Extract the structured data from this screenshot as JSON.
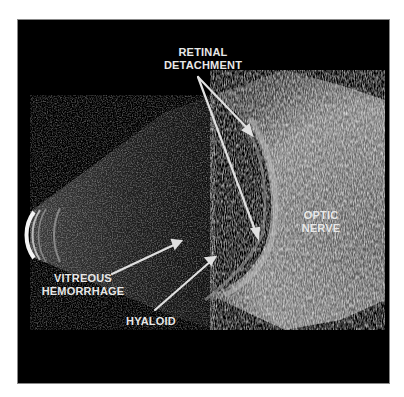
{
  "figure": {
    "type": "ocular B-scan ultrasound",
    "labels": {
      "retinal_detachment": [
        "RETINAL",
        "DETACHMENT"
      ],
      "optic_nerve": [
        "OPTIC",
        "NERVE"
      ],
      "vitreous_hemorrhage": [
        "VITREOUS",
        "HEMORRHAGE"
      ],
      "hyaloid": "HYALOID"
    },
    "colors": {
      "background": "#000000",
      "label": "#e8e8e8",
      "arrow": "#e0e0e0"
    }
  }
}
